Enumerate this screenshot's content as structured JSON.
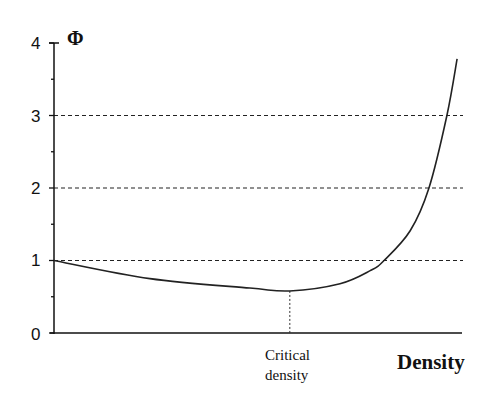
{
  "chart_data": {
    "type": "line",
    "title": "",
    "xlabel": "Density",
    "ylabel": "Φ",
    "ylim": [
      0,
      4
    ],
    "xlim": [
      0,
      1
    ],
    "yticks": [
      0,
      1,
      2,
      3,
      4
    ],
    "ytick_labels": [
      "0",
      "1",
      "2",
      "3",
      "4"
    ],
    "yminor_ticks": [
      0.5,
      1.5,
      2.5,
      3.5
    ],
    "xticks": [],
    "grid": {
      "horizontal_dashed_at": [
        1,
        2,
        3
      ]
    },
    "legend": null,
    "series": [
      {
        "name": "Φ vs Density",
        "x": [
          0.0,
          0.235,
          0.48,
          0.578,
          0.701,
          0.775,
          0.809,
          0.873,
          0.919,
          0.963,
          0.988
        ],
        "y": [
          1.0,
          0.75,
          0.62,
          0.58,
          0.68,
          0.86,
          1.0,
          1.41,
          2.0,
          3.0,
          3.78
        ]
      }
    ],
    "annotations": [
      {
        "text": "Critical density",
        "x": 0.578,
        "y": 0.58,
        "style": "dotted vertical line from curve minimum to x-axis"
      }
    ]
  },
  "labels": {
    "y_axis_symbol": "Φ",
    "x_axis_title": "Density",
    "critical_line1": "Critical",
    "critical_line2": "density",
    "ytick_0": "0",
    "ytick_1": "1",
    "ytick_2": "2",
    "ytick_3": "3",
    "ytick_4": "4"
  }
}
